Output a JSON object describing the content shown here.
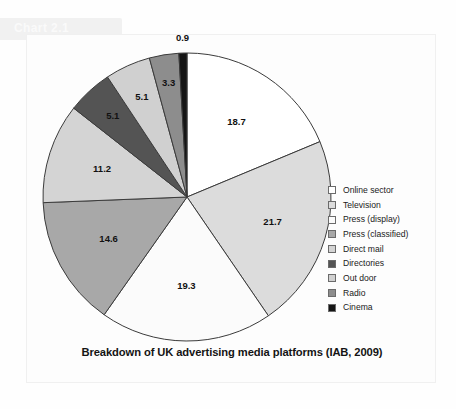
{
  "header": {
    "band_label": "Chart 2.1"
  },
  "chart_data": {
    "type": "pie",
    "title": "Breakdown of UK advertising media platforms (IAB, 2009)",
    "xlabel": "",
    "ylabel": "",
    "legend_position": "right",
    "start_angle_deg": 0,
    "direction": "clockwise",
    "units": "percent",
    "categories": [
      "Online sector",
      "Television",
      "Press (display)",
      "Press (classified)",
      "Direct mail",
      "Directories",
      "Out door",
      "Radio",
      "Cinema"
    ],
    "values": [
      18.7,
      21.7,
      19.3,
      14.6,
      11.2,
      5.1,
      5.1,
      3.3,
      0.9
    ],
    "value_labels": [
      "18.7",
      "21.7",
      "19.3",
      "14.6",
      "11.2",
      "5.1",
      "5.1",
      "3.3",
      "0.9"
    ],
    "colors": [
      "#ffffff",
      "#dcdcdc",
      "#fbfbfb",
      "#a8a8a8",
      "#d4d4d4",
      "#545454",
      "#d0d0d0",
      "#8d8d8d",
      "#151515"
    ],
    "slice_border_color": "#3b3b3b",
    "slices": [
      {
        "label": "Online sector",
        "value": 18.7,
        "value_label": "18.7",
        "color": "#ffffff"
      },
      {
        "label": "Television",
        "value": 21.7,
        "value_label": "21.7",
        "color": "#dcdcdc"
      },
      {
        "label": "Press (display)",
        "value": 19.3,
        "value_label": "19.3",
        "color": "#fbfbfb"
      },
      {
        "label": "Press (classified)",
        "value": 14.6,
        "value_label": "14.6",
        "color": "#a8a8a8"
      },
      {
        "label": "Direct mail",
        "value": 11.2,
        "value_label": "11.2",
        "color": "#d4d4d4"
      },
      {
        "label": "Directories",
        "value": 5.1,
        "value_label": "5.1",
        "color": "#545454"
      },
      {
        "label": "Out door",
        "value": 5.1,
        "value_label": "5.1",
        "color": "#d0d0d0"
      },
      {
        "label": "Radio",
        "value": 3.3,
        "value_label": "3.3",
        "color": "#8d8d8d"
      },
      {
        "label": "Cinema",
        "value": 0.9,
        "value_label": "0.9",
        "color": "#151515"
      }
    ]
  }
}
